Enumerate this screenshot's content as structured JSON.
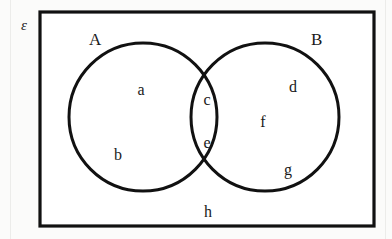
{
  "figure": {
    "type": "venn-diagram",
    "universe_label": "ε",
    "set_labels": {
      "left": "A",
      "right": "B"
    },
    "stroke_color": "#111111",
    "fill_color": "#ffffff",
    "page_background": "#fbfbfa"
  },
  "regions": [
    {
      "id": "a",
      "label": "a",
      "area": "A only",
      "x": 141,
      "y": 90
    },
    {
      "id": "b",
      "label": "b",
      "area": "A only",
      "x": 118,
      "y": 155
    },
    {
      "id": "c",
      "label": "c",
      "area": "A and B",
      "x": 207,
      "y": 100
    },
    {
      "id": "e",
      "label": "e",
      "area": "A and B",
      "x": 207,
      "y": 143
    },
    {
      "id": "d",
      "label": "d",
      "area": "B only",
      "x": 293,
      "y": 87
    },
    {
      "id": "f",
      "label": "f",
      "area": "B only",
      "x": 263,
      "y": 122
    },
    {
      "id": "g",
      "label": "g",
      "area": "B only",
      "x": 288,
      "y": 170
    },
    {
      "id": "h",
      "label": "h",
      "area": "outside A and B",
      "x": 208,
      "y": 212
    }
  ],
  "geometry": {
    "universe": {
      "x": 40,
      "y": 12,
      "width": 334,
      "height": 214
    },
    "circle_left": {
      "cx": 143,
      "cy": 117,
      "r": 74
    },
    "circle_right": {
      "cx": 265,
      "cy": 117,
      "r": 74
    },
    "universe_label_pos": {
      "x": 21,
      "y": 18
    },
    "set_label_left_pos": {
      "x": 89,
      "y": 31
    },
    "set_label_right_pos": {
      "x": 311,
      "y": 31
    }
  }
}
